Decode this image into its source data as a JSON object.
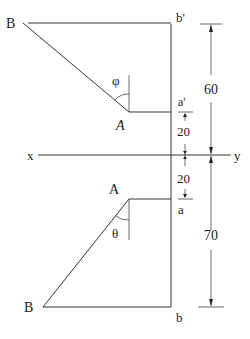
{
  "diagram": {
    "type": "orthographic-projection",
    "axis": {
      "left_label": "x",
      "right_label": "y"
    },
    "front_view": {
      "point_B_label": "B",
      "point_A_label": "A",
      "point_b_prime_label": "b'",
      "point_a_prime_label": "a'",
      "angle_label": "φ"
    },
    "top_view": {
      "point_A_label": "A",
      "point_B_label": "B",
      "point_a_label": "a",
      "point_b_label": "b",
      "angle_label": "θ"
    },
    "dimensions": {
      "upper_total": "60",
      "a_prime_above_xy": "20",
      "a_below_xy": "20",
      "lower_total": "70"
    }
  }
}
